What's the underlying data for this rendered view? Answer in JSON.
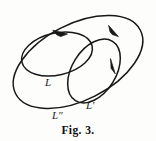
{
  "figure": {
    "caption": "Fig. 3.",
    "stroke_color": "#171717",
    "background_color": "#fdfdfc",
    "labels": [
      {
        "id": "L",
        "text": "L",
        "x": 45,
        "y": 77,
        "curve": "inner-left-loop"
      },
      {
        "id": "Lp",
        "text": "L′",
        "x": 86,
        "y": 100,
        "curve": "inner-right-loop"
      },
      {
        "id": "Lpp",
        "text": "L″",
        "x": 52,
        "y": 110,
        "curve": "outer-loop"
      }
    ],
    "curves": [
      {
        "name": "outer-loop",
        "label": "L″",
        "type": "closed-oriented-ellipse",
        "cx": 78,
        "cy": 62,
        "rx": 70,
        "ry": 38,
        "rotation_deg": -27,
        "orientation": "clockwise",
        "arrow": {
          "x": 115,
          "y": 33,
          "angle_deg": 57
        }
      },
      {
        "name": "inner-left-loop",
        "label": "L",
        "type": "closed-oriented-ellipse",
        "cx": 57,
        "cy": 54,
        "rx": 36,
        "ry": 21,
        "rotation_deg": -13,
        "orientation": "clockwise",
        "arrow": {
          "x": 62,
          "y": 33,
          "angle_deg": 8
        }
      },
      {
        "name": "inner-right-loop",
        "label": "L′",
        "type": "closed-oriented-ellipse",
        "cx": 94,
        "cy": 71,
        "rx": 35,
        "ry": 22,
        "rotation_deg": -58,
        "orientation": "clockwise",
        "arrow": {
          "x": 114,
          "y": 69,
          "angle_deg": 103
        }
      }
    ]
  }
}
